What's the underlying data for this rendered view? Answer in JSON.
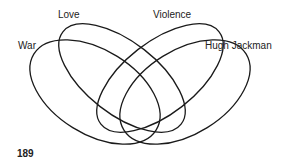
{
  "diagram": {
    "type": "venn-4",
    "sets": [
      {
        "name": "War",
        "label_x": 18,
        "label_y": 40
      },
      {
        "name": "Love",
        "label_x": 58,
        "label_y": 9
      },
      {
        "name": "Violence",
        "label_x": 153,
        "label_y": 9
      },
      {
        "name": "Hugh Jackman",
        "label_x": 205,
        "label_y": 40
      }
    ],
    "stroke_color": "#1a1a1a"
  },
  "page_number": "189"
}
